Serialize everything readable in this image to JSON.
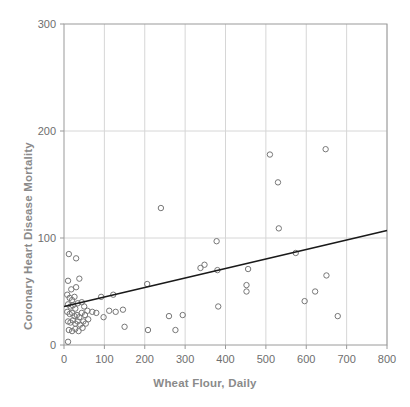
{
  "chart_data": {
    "type": "scatter",
    "title": "",
    "xlabel": "Wheat Flour, Daily",
    "ylabel": "Coronary Heart Disease Mortality",
    "xlim": [
      0,
      800
    ],
    "ylim": [
      0,
      300
    ],
    "xticks": [
      0,
      100,
      200,
      300,
      400,
      500,
      600,
      700,
      800
    ],
    "yticks": [
      0,
      100,
      200,
      300
    ],
    "xtick_labels": [
      "0",
      "100",
      "200",
      "300",
      "400",
      "500",
      "600",
      "700",
      "800"
    ],
    "ytick_labels": [
      "0",
      "100",
      "200",
      "300"
    ],
    "grid": true,
    "legend": "none",
    "marker": "open-circle",
    "marker_color": "#777777",
    "trendline": {
      "type": "linear",
      "color": "#1a1a1a",
      "x0": 0,
      "y0": 36,
      "x1": 800,
      "y1": 107
    },
    "points": [
      {
        "x": 10,
        "y": 3
      },
      {
        "x": 12,
        "y": 85
      },
      {
        "x": 30,
        "y": 81
      },
      {
        "x": 10,
        "y": 60
      },
      {
        "x": 38,
        "y": 62
      },
      {
        "x": 18,
        "y": 52
      },
      {
        "x": 30,
        "y": 54
      },
      {
        "x": 8,
        "y": 47
      },
      {
        "x": 14,
        "y": 44
      },
      {
        "x": 20,
        "y": 42
      },
      {
        "x": 26,
        "y": 45
      },
      {
        "x": 10,
        "y": 38
      },
      {
        "x": 16,
        "y": 36
      },
      {
        "x": 22,
        "y": 37
      },
      {
        "x": 28,
        "y": 34
      },
      {
        "x": 34,
        "y": 39
      },
      {
        "x": 44,
        "y": 40
      },
      {
        "x": 50,
        "y": 36
      },
      {
        "x": 8,
        "y": 31
      },
      {
        "x": 14,
        "y": 29
      },
      {
        "x": 20,
        "y": 30
      },
      {
        "x": 26,
        "y": 27
      },
      {
        "x": 32,
        "y": 28
      },
      {
        "x": 38,
        "y": 26
      },
      {
        "x": 44,
        "y": 30
      },
      {
        "x": 52,
        "y": 28
      },
      {
        "x": 58,
        "y": 32
      },
      {
        "x": 10,
        "y": 22
      },
      {
        "x": 16,
        "y": 21
      },
      {
        "x": 22,
        "y": 23
      },
      {
        "x": 28,
        "y": 20
      },
      {
        "x": 34,
        "y": 22
      },
      {
        "x": 40,
        "y": 19
      },
      {
        "x": 48,
        "y": 22
      },
      {
        "x": 54,
        "y": 20
      },
      {
        "x": 12,
        "y": 14
      },
      {
        "x": 20,
        "y": 13
      },
      {
        "x": 28,
        "y": 15
      },
      {
        "x": 36,
        "y": 13
      },
      {
        "x": 46,
        "y": 16
      },
      {
        "x": 60,
        "y": 24
      },
      {
        "x": 70,
        "y": 31
      },
      {
        "x": 80,
        "y": 30
      },
      {
        "x": 92,
        "y": 45
      },
      {
        "x": 98,
        "y": 26
      },
      {
        "x": 112,
        "y": 32
      },
      {
        "x": 122,
        "y": 47
      },
      {
        "x": 128,
        "y": 31
      },
      {
        "x": 146,
        "y": 33
      },
      {
        "x": 150,
        "y": 17
      },
      {
        "x": 206,
        "y": 57
      },
      {
        "x": 208,
        "y": 14
      },
      {
        "x": 240,
        "y": 128
      },
      {
        "x": 260,
        "y": 27
      },
      {
        "x": 276,
        "y": 14
      },
      {
        "x": 294,
        "y": 28
      },
      {
        "x": 338,
        "y": 72
      },
      {
        "x": 348,
        "y": 75
      },
      {
        "x": 378,
        "y": 97
      },
      {
        "x": 380,
        "y": 70
      },
      {
        "x": 382,
        "y": 36
      },
      {
        "x": 452,
        "y": 56
      },
      {
        "x": 452,
        "y": 50
      },
      {
        "x": 456,
        "y": 71
      },
      {
        "x": 510,
        "y": 178
      },
      {
        "x": 530,
        "y": 152
      },
      {
        "x": 532,
        "y": 109
      },
      {
        "x": 574,
        "y": 86
      },
      {
        "x": 596,
        "y": 41
      },
      {
        "x": 622,
        "y": 50
      },
      {
        "x": 648,
        "y": 183
      },
      {
        "x": 650,
        "y": 65
      },
      {
        "x": 678,
        "y": 27
      }
    ]
  }
}
